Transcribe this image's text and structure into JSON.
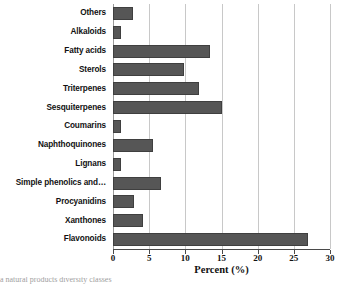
{
  "chart_data": {
    "type": "bar",
    "orientation": "horizontal",
    "title": "",
    "xlabel": "Percent (%)",
    "ylabel": "",
    "xlim": [
      0,
      30
    ],
    "xticks": [
      0,
      5,
      10,
      15,
      20,
      25,
      30
    ],
    "xtick_labels": [
      "0",
      "5",
      "10",
      "15",
      "20",
      "25",
      "30"
    ],
    "grid": "vertical",
    "legend": "none",
    "bar_color": "#565656",
    "bar_edge_color": "#3f3f3f",
    "gridline_color": "#c8c8c8",
    "axis_color": "#4a4a4a",
    "background_color": "#ffffff",
    "categories": [
      "Others",
      "Alkaloids",
      "Fatty acids",
      "Sterols",
      "Triterpenes",
      "Sesquiterpenes",
      "Coumarins",
      "Naphthoquinones",
      "Lignans",
      "Simple phenolics and…",
      "Procyanidins",
      "Xanthones",
      "Flavonoids"
    ],
    "values": [
      2.8,
      1.1,
      13.4,
      9.8,
      11.9,
      15.0,
      1.1,
      5.5,
      1.1,
      6.6,
      2.9,
      4.2,
      27.0
    ]
  },
  "caption": {
    "clipped_text": "a natural products diversity classes"
  }
}
